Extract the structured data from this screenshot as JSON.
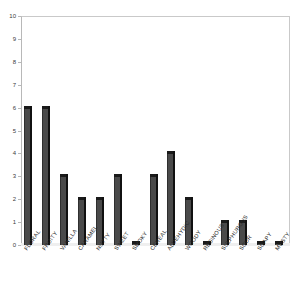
{
  "chart_data": {
    "type": "bar",
    "title": "",
    "subtitle": "",
    "xlabel": "",
    "ylabel": "",
    "ylim": [
      0,
      10
    ],
    "grid": false,
    "legend": "none",
    "categories": [
      "FLORAL",
      "FRUITY",
      "VANILLA",
      "CARAMEL",
      "NUTTY",
      "SWEET",
      "SMOKY",
      "CEREAL",
      "ALDEHYDIC",
      "WOODY",
      "RESINOUS",
      "SULPHUROUS",
      "SOUR",
      "SOAPY",
      "MUSTY"
    ],
    "values": [
      6,
      6,
      3,
      2,
      2,
      3,
      0,
      3,
      4,
      2,
      0,
      1,
      1,
      0,
      0
    ],
    "y_ticks": [
      "0",
      "1",
      "2",
      "3",
      "4",
      "5",
      "6",
      "7",
      "8",
      "9",
      "10"
    ],
    "series_color": "#4a4a4a"
  },
  "axis": {
    "y_label_color": "#3a3a3a",
    "frame_color": "#b8b8b8"
  }
}
